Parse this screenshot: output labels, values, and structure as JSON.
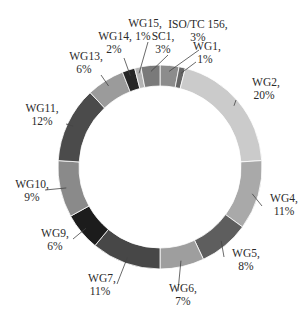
{
  "chart_data": {
    "type": "pie",
    "subtype": "donut",
    "title": "",
    "start_angle_deg": 0,
    "direction": "clockwise",
    "categories": [
      "ISO/TC 156",
      "WG1",
      "WG2",
      "WG4",
      "WG5",
      "WG6",
      "WG7",
      "WG9",
      "WG10",
      "WG11",
      "WG13",
      "WG14",
      "WG15",
      "SC1"
    ],
    "values": [
      3,
      1,
      20,
      11,
      8,
      7,
      11,
      6,
      9,
      12,
      6,
      2,
      1,
      3
    ],
    "value_unit": "%",
    "colors": [
      "#8c8c8c",
      "#666666",
      "#cbcbcb",
      "#a9a9a9",
      "#5e5e5e",
      "#9e9e9e",
      "#474747",
      "#1c1c1c",
      "#8a8a8a",
      "#4b4b4b",
      "#9b9b9b",
      "#262626",
      "#b4b4b4",
      "#7a7a7a"
    ],
    "labels": [
      {
        "name": "ISO/TC 156,",
        "pct": "3%"
      },
      {
        "name": "WG1,",
        "pct": "1%"
      },
      {
        "name": "WG2,",
        "pct": "20%"
      },
      {
        "name": "WG4,",
        "pct": "11%"
      },
      {
        "name": "WG5,",
        "pct": "8%"
      },
      {
        "name": "WG6,",
        "pct": "7%"
      },
      {
        "name": "WG7,",
        "pct": "11%"
      },
      {
        "name": "WG9,",
        "pct": "6%"
      },
      {
        "name": "WG10,",
        "pct": "9%"
      },
      {
        "name": "WG11,",
        "pct": "12%"
      },
      {
        "name": "WG13,",
        "pct": "6%"
      },
      {
        "name": "WG14,",
        "pct": "2%"
      },
      {
        "name": "WG15,",
        "pct": "1%"
      },
      {
        "name": "SC1,",
        "pct": "3%"
      }
    ],
    "legend": "none (inline labels with leader lines)"
  }
}
